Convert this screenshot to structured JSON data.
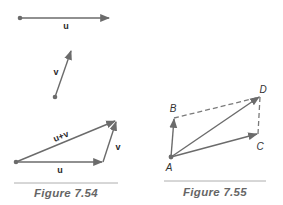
{
  "figures": [
    {
      "id": "fig-7-54",
      "caption": "Figure 7.54",
      "vectors": {
        "u": {
          "label": "u"
        },
        "v": {
          "label": "v"
        },
        "sum": {
          "label": "u+v"
        },
        "triangle_u": {
          "label": "u"
        },
        "triangle_v": {
          "label": "v"
        }
      }
    },
    {
      "id": "fig-7-55",
      "caption": "Figure 7.55",
      "points": {
        "A": "A",
        "B": "B",
        "C": "C",
        "D": "D"
      }
    }
  ],
  "colors": {
    "line": "#6b6b6b",
    "dashed": "#7a7a7a",
    "rule": "#9a9a9a",
    "caption": "#666666"
  }
}
